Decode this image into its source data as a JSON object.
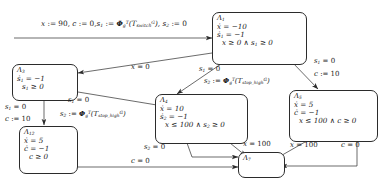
{
  "diagram": {
    "type": "hybrid-automaton",
    "title": "",
    "nodes": [
      {
        "id": "L1",
        "name": "Λ₁",
        "lines": [
          "ẋ = −10",
          "ṡ₁ = −1",
          "x ≥ 0 ∧ s₁ ≥ 0"
        ]
      },
      {
        "id": "L3",
        "name": "Λ₃",
        "lines": [
          "ṡ₁ = −1",
          "s₁ ≥ 0"
        ]
      },
      {
        "id": "L12",
        "name": "Λ₁₂",
        "lines": [
          "ẋ = 5",
          "ċ = −1",
          "c ≥ 0"
        ]
      },
      {
        "id": "L4",
        "name": "Λ₄",
        "lines": [
          "ẋ = 10",
          "ṡ₂ = −1",
          "x ≤ 100 ∧ s₂ ≥ 0"
        ]
      },
      {
        "id": "L5",
        "name": "Λ₅",
        "lines": [
          "ẋ = 5",
          "ċ = −1",
          "x ≤ 100 ∧ c ≥ 0"
        ]
      },
      {
        "id": "L7",
        "name": "Λ₇",
        "lines": []
      }
    ],
    "edges": [
      {
        "id": "init",
        "from": "",
        "to": "L1",
        "label": "x := 90, c := 0, s₁ := Φᵍᵀ(Tᴳswitch), s₂ := 0"
      },
      {
        "id": "L1_L3",
        "from": "L1",
        "to": "L3",
        "label": "x = 0"
      },
      {
        "id": "L1_L4",
        "from": "L1",
        "to": "L4",
        "label": "s₁ = 0   s₂ := Φᵍᵀ(Tᴳstop_high)"
      },
      {
        "id": "L1_L5",
        "from": "L1",
        "to": "L5",
        "label": "s₁ = 0   c := 10"
      },
      {
        "id": "L3_L12",
        "from": "L3",
        "to": "L12",
        "label": "s₁ = 0   c := 10"
      },
      {
        "id": "L3_L4",
        "from": "L3",
        "to": "L4",
        "label": "s₁ = 0   s₂ := Φᵍᵀ(Tᴳstop_high)"
      },
      {
        "id": "L4_L7a",
        "from": "L4",
        "to": "L7",
        "label": "s₂ = 0"
      },
      {
        "id": "L4_L7b",
        "from": "L4",
        "to": "L7",
        "label": "x = 100"
      },
      {
        "id": "L5_L7a",
        "from": "L5",
        "to": "L7",
        "label": "x = 100"
      },
      {
        "id": "L5_L7b",
        "from": "L5",
        "to": "L7",
        "label": "c = 0"
      },
      {
        "id": "L12_L7",
        "from": "L12",
        "to": "L7",
        "label": "c = 0"
      }
    ]
  },
  "nodes": {
    "L1": {
      "title": "Λ",
      "idx": "1",
      "l1": "= −10",
      "l2": "= −1",
      "l3": "x ≥ 0 ∧ s",
      "l3b": "≥ 0"
    },
    "L3": {
      "title": "Λ",
      "idx": "3"
    },
    "L12": {
      "title": "Λ",
      "idx": "12"
    },
    "L4": {
      "title": "Λ",
      "idx": "4"
    },
    "L5": {
      "title": "Λ",
      "idx": "5"
    },
    "L7": {
      "title": "Λ",
      "idx": "7"
    }
  },
  "text": {
    "init_p1": "x",
    "init_p2": ":= 90,",
    "init_c": "c",
    "init_c2": ":= 0,",
    "init_s1": "s",
    "init_s1i": "1",
    "init_s1a": ":=",
    "phi": "Φ",
    "phi_sub": "g",
    "phi_sup": "T",
    "T": "T",
    "T_switch_sub": "switch",
    "T_sup": "G",
    "T_stop_sub": "stop_high",
    "init_s2": "s",
    "init_s2i": "2",
    "init_s2a": ":= 0",
    "x_eq_0": "x = 0",
    "s1_eq_0": "s",
    "s1_eq_0_sub": "1",
    "s1_eq_0_tail": "= 0",
    "s2_assign": "s",
    "s2_assign_sub": "2",
    "s2_assign_tail": ":=",
    "c_assign_10": "c := 10",
    "s2_eq_0": "s",
    "s2_eq_0_sub": "2",
    "s2_eq_0_tail": "= 0",
    "x_eq_100": "x = 100",
    "c_eq_0": "c = 0",
    "dot_x": "ẋ",
    "dot_c": "ċ",
    "dot_s": "ṡ",
    "eq_m10": "= −10",
    "eq_m1": "= −1",
    "eq_5": "= 5",
    "eq_10": "= 10",
    "ge0_x_s1": "x ≥ 0 ∧ s",
    "ge0_tail": "≥ 0",
    "ge0_s1": "s",
    "ge0_s1_tail": "≥ 0",
    "ge0_c": "c ≥ 0",
    "le100_s2": "x ≤ 100 ∧ s",
    "le100_c": "x ≤ 100 ∧ c ≥ 0"
  }
}
